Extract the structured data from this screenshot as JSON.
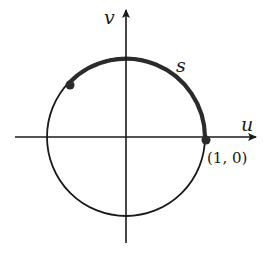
{
  "diagram": {
    "type": "unit-circle-arc",
    "axes": {
      "horizontal_label": "u",
      "vertical_label": "v"
    },
    "arc_label": "s",
    "point_label": "(1, 0)",
    "colors": {
      "stroke": "#1a1a1a",
      "thick_arc": "#2b2b2b",
      "background": "#ffffff"
    }
  }
}
